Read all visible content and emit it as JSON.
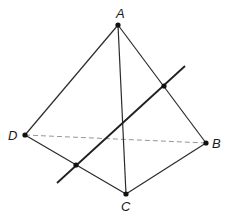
{
  "diagram": {
    "type": "tetrahedron",
    "vertices": {
      "A": {
        "label": "A",
        "x": 118,
        "y": 25,
        "label_x": 116,
        "label_y": 18
      },
      "B": {
        "label": "B",
        "x": 206,
        "y": 143,
        "label_x": 212,
        "label_y": 148
      },
      "C": {
        "label": "C",
        "x": 126,
        "y": 194,
        "label_x": 121,
        "label_y": 211
      },
      "D": {
        "label": "D",
        "x": 25,
        "y": 135,
        "label_x": 8,
        "label_y": 140
      }
    },
    "edges": [
      {
        "from": "A",
        "to": "D",
        "style": "solid"
      },
      {
        "from": "A",
        "to": "B",
        "style": "solid"
      },
      {
        "from": "A",
        "to": "C",
        "style": "solid"
      },
      {
        "from": "D",
        "to": "C",
        "style": "solid"
      },
      {
        "from": "C",
        "to": "B",
        "style": "solid"
      },
      {
        "from": "D",
        "to": "B",
        "style": "dashed"
      }
    ],
    "secant_line": {
      "x1": 57,
      "y1": 183,
      "x2": 185,
      "y2": 66
    },
    "intersection_points": [
      {
        "on_edge": "AB",
        "x": 164,
        "y": 86
      },
      {
        "on_edge": "DC",
        "x": 76,
        "y": 165
      }
    ],
    "colors": {
      "edge": "#2b2b2b",
      "hidden_edge": "#8a8a8a",
      "point": "#111111",
      "background": "#ffffff"
    }
  }
}
